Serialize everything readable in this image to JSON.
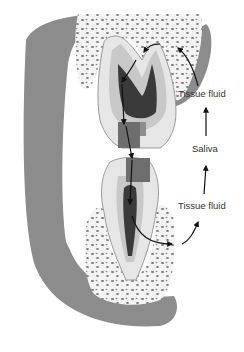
{
  "diagram": {
    "labels": {
      "tissue_fluid_upper": "Tissue fluid",
      "saliva": "Saliva",
      "tissue_fluid_lower": "Tissue fluid"
    },
    "colors": {
      "gum": "#8c8c8c",
      "bone": "#f4f4f4",
      "bone_spots": "#7a7a7a",
      "enamel": "#e6e6e6",
      "dentin": "#c8c8c8",
      "pulp": "#3a3a3a",
      "filling": "#6e6e6e",
      "arrow": "#111111",
      "text": "#333333"
    }
  }
}
